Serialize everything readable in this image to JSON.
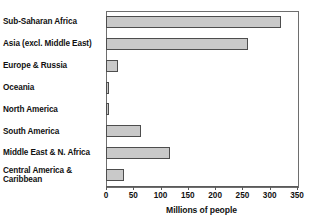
{
  "chart_data": {
    "type": "bar",
    "orientation": "horizontal",
    "title": "",
    "xlabel": "Millions of people",
    "ylabel": "",
    "xlim": [
      0,
      350
    ],
    "xticks": [
      0,
      50,
      100,
      150,
      200,
      250,
      300,
      350
    ],
    "grid": false,
    "legend": null,
    "categories": [
      "Sub-Saharan Africa",
      "Asia (excl. Middle East)",
      "Europe & Russia",
      "Oceania",
      "North America",
      "South America",
      "Middle East & N. Africa",
      "Central America & Caribbean"
    ],
    "values": [
      320,
      260,
      22,
      3,
      5,
      64,
      117,
      33
    ],
    "bar_fill_color": "#c9c9c9",
    "bar_border_color": "#4d4d4d"
  },
  "axis": {
    "x_title": "Millions of people",
    "tick_labels": [
      "0",
      "50",
      "100",
      "150",
      "200",
      "250",
      "300",
      "350"
    ]
  },
  "category_labels": [
    {
      "line1": "Sub-Saharan Africa",
      "line2": ""
    },
    {
      "line1": "Asia (excl. Middle East)",
      "line2": ""
    },
    {
      "line1": "Europe & Russia",
      "line2": ""
    },
    {
      "line1": "Oceania",
      "line2": ""
    },
    {
      "line1": "North America",
      "line2": ""
    },
    {
      "line1": "South America",
      "line2": ""
    },
    {
      "line1": "Middle East & N. Africa",
      "line2": ""
    },
    {
      "line1": "Central America &",
      "line2": "Caribbean"
    }
  ],
  "top_clipped_text": ""
}
